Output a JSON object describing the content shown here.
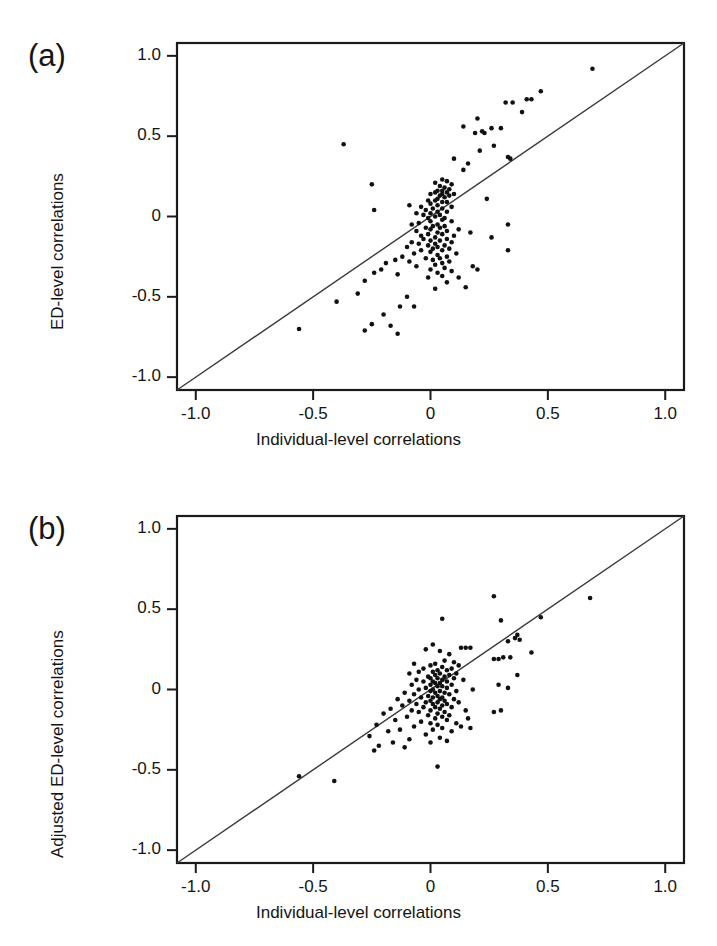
{
  "figure": {
    "type": "scientific-figure",
    "panel_count": 2,
    "background_color": "#ffffff",
    "ink_color": "#141414"
  },
  "panels": [
    {
      "tag": "(a)",
      "tag_name": "panel-a",
      "x_axis_label": "Individual-level correlations",
      "y_axis_label": "ED-level correlations"
    },
    {
      "tag": "(b)",
      "tag_name": "panel-b",
      "x_axis_label": "Individual-level correlations",
      "y_axis_label": "Adjusted ED-level correlations"
    }
  ],
  "ticks": {
    "x": [
      "-1.0",
      "-0.5",
      "0",
      "0.5",
      "1.0"
    ],
    "y": [
      "1.0",
      "0.5",
      "0",
      "-0.5",
      "-1.0"
    ],
    "x_values": [
      -1.0,
      -0.5,
      0,
      0.5,
      1.0
    ],
    "y_values": [
      1.0,
      0.5,
      0,
      -0.5,
      -1.0
    ]
  },
  "chart_data": [
    {
      "type": "scatter",
      "panel": "(a)",
      "title": "",
      "xlabel": "Individual-level correlations",
      "ylabel": "ED-level correlations",
      "xlim": [
        -1.08,
        1.08
      ],
      "ylim": [
        -1.08,
        1.08
      ],
      "grid": false,
      "legend": false,
      "marker": "filled-circle",
      "marker_color": "#111111",
      "marker_size_px": 4.6,
      "annotations": [
        {
          "kind": "reference-line",
          "label": "y = x identity line",
          "from": [
            -1.08,
            -1.08
          ],
          "to": [
            1.08,
            1.08
          ],
          "color": "#333333"
        }
      ],
      "n_points": 143,
      "points": [
        [
          0.69,
          0.92
        ],
        [
          0.47,
          0.78
        ],
        [
          0.41,
          0.73
        ],
        [
          0.43,
          0.73
        ],
        [
          0.32,
          0.71
        ],
        [
          0.35,
          0.71
        ],
        [
          0.39,
          0.65
        ],
        [
          0.2,
          0.61
        ],
        [
          0.14,
          0.56
        ],
        [
          0.26,
          0.55
        ],
        [
          0.3,
          0.55
        ],
        [
          0.22,
          0.53
        ],
        [
          0.23,
          0.52
        ],
        [
          0.19,
          0.52
        ],
        [
          -0.37,
          0.45
        ],
        [
          0.27,
          0.44
        ],
        [
          0.21,
          0.41
        ],
        [
          0.33,
          0.37
        ],
        [
          0.34,
          0.36
        ],
        [
          0.1,
          0.36
        ],
        [
          0.16,
          0.33
        ],
        [
          0.14,
          0.29
        ],
        [
          -0.25,
          0.2
        ],
        [
          0.05,
          0.23
        ],
        [
          0.07,
          0.22
        ],
        [
          0.02,
          0.21
        ],
        [
          0.09,
          0.2
        ],
        [
          0.04,
          0.19
        ],
        [
          0.06,
          0.18
        ],
        [
          0.08,
          0.17
        ],
        [
          0.03,
          0.16
        ],
        [
          0.05,
          0.16
        ],
        [
          0.07,
          0.15
        ],
        [
          0.02,
          0.15
        ],
        [
          0.1,
          0.14
        ],
        [
          0.05,
          0.14
        ],
        [
          0.0,
          0.14
        ],
        [
          0.04,
          0.13
        ],
        [
          0.08,
          0.13
        ],
        [
          0.06,
          0.12
        ],
        [
          0.24,
          0.11
        ],
        [
          0.03,
          0.11
        ],
        [
          -0.01,
          0.1
        ],
        [
          0.02,
          0.1
        ],
        [
          0.07,
          0.09
        ],
        [
          0.05,
          0.09
        ],
        [
          -0.09,
          0.07
        ],
        [
          0.0,
          0.08
        ],
        [
          0.03,
          0.07
        ],
        [
          0.09,
          0.06
        ],
        [
          -0.04,
          0.06
        ],
        [
          0.01,
          0.05
        ],
        [
          0.05,
          0.05
        ],
        [
          -0.24,
          0.04
        ],
        [
          -0.02,
          0.04
        ],
        [
          0.03,
          0.03
        ],
        [
          0.07,
          0.03
        ],
        [
          -0.06,
          0.02
        ],
        [
          0.0,
          0.02
        ],
        [
          0.04,
          0.01
        ],
        [
          -0.03,
          0.01
        ],
        [
          0.02,
          0.0
        ],
        [
          0.06,
          -0.01
        ],
        [
          -0.01,
          -0.01
        ],
        [
          0.33,
          -0.05
        ],
        [
          0.05,
          -0.02
        ],
        [
          0.0,
          -0.03
        ],
        [
          0.09,
          -0.03
        ],
        [
          -0.05,
          -0.04
        ],
        [
          0.03,
          -0.05
        ],
        [
          -0.08,
          -0.05
        ],
        [
          0.01,
          -0.06
        ],
        [
          0.06,
          -0.06
        ],
        [
          0.04,
          -0.07
        ],
        [
          -0.02,
          -0.07
        ],
        [
          0.12,
          -0.08
        ],
        [
          0.0,
          -0.08
        ],
        [
          0.07,
          -0.09
        ],
        [
          -0.06,
          -0.09
        ],
        [
          0.17,
          -0.1
        ],
        [
          0.03,
          -0.1
        ],
        [
          -0.01,
          -0.11
        ],
        [
          0.05,
          -0.11
        ],
        [
          0.1,
          -0.12
        ],
        [
          -0.04,
          -0.12
        ],
        [
          0.02,
          -0.13
        ],
        [
          0.26,
          -0.13
        ],
        [
          0.07,
          -0.14
        ],
        [
          -0.03,
          -0.14
        ],
        [
          0.0,
          -0.15
        ],
        [
          0.04,
          -0.15
        ],
        [
          -0.08,
          -0.16
        ],
        [
          0.09,
          -0.16
        ],
        [
          0.02,
          -0.17
        ],
        [
          0.33,
          -0.21
        ],
        [
          -0.05,
          -0.17
        ],
        [
          0.06,
          -0.18
        ],
        [
          -0.01,
          -0.18
        ],
        [
          0.03,
          -0.19
        ],
        [
          -0.1,
          -0.19
        ],
        [
          0.01,
          -0.2
        ],
        [
          0.08,
          -0.2
        ],
        [
          -0.04,
          -0.21
        ],
        [
          0.05,
          -0.21
        ],
        [
          0.0,
          -0.22
        ],
        [
          0.11,
          -0.23
        ],
        [
          -0.07,
          -0.23
        ],
        [
          0.03,
          -0.24
        ],
        [
          -0.12,
          -0.25
        ],
        [
          0.07,
          -0.25
        ],
        [
          -0.02,
          -0.26
        ],
        [
          0.04,
          -0.26
        ],
        [
          -0.15,
          -0.27
        ],
        [
          0.01,
          -0.27
        ],
        [
          0.08,
          -0.28
        ],
        [
          -0.09,
          -0.28
        ],
        [
          -0.19,
          -0.29
        ],
        [
          0.05,
          -0.29
        ],
        [
          0.02,
          -0.3
        ],
        [
          0.18,
          -0.31
        ],
        [
          0.2,
          -0.33
        ],
        [
          -0.06,
          -0.31
        ],
        [
          0.06,
          -0.32
        ],
        [
          -0.21,
          -0.33
        ],
        [
          0.0,
          -0.33
        ],
        [
          0.09,
          -0.34
        ],
        [
          -0.24,
          -0.35
        ],
        [
          0.03,
          -0.35
        ],
        [
          -0.14,
          -0.36
        ],
        [
          0.05,
          -0.37
        ],
        [
          0.12,
          -0.38
        ],
        [
          -0.01,
          -0.38
        ],
        [
          -0.28,
          -0.4
        ],
        [
          0.07,
          -0.41
        ],
        [
          0.15,
          -0.44
        ],
        [
          0.02,
          -0.45
        ],
        [
          -0.31,
          -0.48
        ],
        [
          -0.1,
          -0.5
        ],
        [
          -0.4,
          -0.53
        ],
        [
          -0.13,
          -0.56
        ],
        [
          -0.07,
          -0.56
        ],
        [
          -0.2,
          -0.61
        ],
        [
          -0.25,
          -0.67
        ],
        [
          -0.17,
          -0.68
        ],
        [
          -0.56,
          -0.7
        ],
        [
          -0.28,
          -0.71
        ],
        [
          -0.14,
          -0.73
        ]
      ]
    },
    {
      "type": "scatter",
      "panel": "(b)",
      "title": "",
      "xlabel": "Individual-level correlations",
      "ylabel": "Adjusted ED-level correlations",
      "xlim": [
        -1.08,
        1.08
      ],
      "ylim": [
        -1.08,
        1.08
      ],
      "grid": false,
      "legend": false,
      "marker": "filled-circle",
      "marker_color": "#111111",
      "marker_size_px": 4.6,
      "annotations": [
        {
          "kind": "reference-line",
          "label": "y = x identity line",
          "from": [
            -1.08,
            -1.08
          ],
          "to": [
            1.08,
            1.08
          ],
          "color": "#333333"
        }
      ],
      "n_points": 140,
      "points": [
        [
          0.68,
          0.57
        ],
        [
          0.27,
          0.58
        ],
        [
          0.47,
          0.45
        ],
        [
          0.05,
          0.44
        ],
        [
          0.3,
          0.43
        ],
        [
          0.37,
          0.34
        ],
        [
          0.36,
          0.32
        ],
        [
          0.38,
          0.31
        ],
        [
          0.33,
          0.3
        ],
        [
          0.01,
          0.28
        ],
        [
          0.13,
          0.26
        ],
        [
          0.15,
          0.26
        ],
        [
          0.17,
          0.26
        ],
        [
          -0.02,
          0.25
        ],
        [
          0.04,
          0.24
        ],
        [
          0.43,
          0.23
        ],
        [
          0.08,
          0.22
        ],
        [
          0.31,
          0.2
        ],
        [
          0.34,
          0.2
        ],
        [
          0.27,
          0.19
        ],
        [
          0.29,
          0.19
        ],
        [
          0.06,
          0.18
        ],
        [
          0.1,
          0.17
        ],
        [
          -0.07,
          0.16
        ],
        [
          0.02,
          0.16
        ],
        [
          0.12,
          0.15
        ],
        [
          0.0,
          0.15
        ],
        [
          0.05,
          0.14
        ],
        [
          0.09,
          0.13
        ],
        [
          -0.03,
          0.13
        ],
        [
          0.03,
          0.12
        ],
        [
          0.07,
          0.12
        ],
        [
          0.01,
          0.11
        ],
        [
          -0.05,
          0.11
        ],
        [
          0.04,
          0.1
        ],
        [
          0.11,
          0.1
        ],
        [
          -0.09,
          0.1
        ],
        [
          0.08,
          0.09
        ],
        [
          0.02,
          0.09
        ],
        [
          0.06,
          0.08
        ],
        [
          -0.01,
          0.08
        ],
        [
          0.0,
          0.07
        ],
        [
          0.03,
          0.07
        ],
        [
          0.1,
          0.07
        ],
        [
          -0.06,
          0.06
        ],
        [
          0.05,
          0.06
        ],
        [
          0.14,
          0.06
        ],
        [
          0.01,
          0.05
        ],
        [
          0.07,
          0.05
        ],
        [
          -0.03,
          0.05
        ],
        [
          0.04,
          0.04
        ],
        [
          0.37,
          0.09
        ],
        [
          0.02,
          0.04
        ],
        [
          0.09,
          0.03
        ],
        [
          -0.08,
          0.03
        ],
        [
          0.0,
          0.03
        ],
        [
          0.29,
          0.03
        ],
        [
          0.05,
          0.02
        ],
        [
          0.03,
          0.02
        ],
        [
          0.33,
          0.01
        ],
        [
          -0.02,
          0.01
        ],
        [
          0.07,
          0.01
        ],
        [
          0.01,
          0.0
        ],
        [
          0.18,
          0.0
        ],
        [
          -0.05,
          0.0
        ],
        [
          0.04,
          -0.01
        ],
        [
          0.11,
          -0.01
        ],
        [
          0.0,
          -0.01
        ],
        [
          0.06,
          -0.02
        ],
        [
          -0.11,
          -0.02
        ],
        [
          0.02,
          -0.02
        ],
        [
          -0.07,
          -0.03
        ],
        [
          0.08,
          -0.03
        ],
        [
          0.03,
          -0.04
        ],
        [
          -0.01,
          -0.04
        ],
        [
          0.05,
          -0.05
        ],
        [
          -0.04,
          -0.05
        ],
        [
          0.01,
          -0.05
        ],
        [
          0.1,
          -0.06
        ],
        [
          -0.14,
          -0.06
        ],
        [
          0.04,
          -0.06
        ],
        [
          -0.09,
          -0.07
        ],
        [
          0.06,
          -0.07
        ],
        [
          0.0,
          -0.07
        ],
        [
          -0.02,
          -0.08
        ],
        [
          0.03,
          -0.08
        ],
        [
          0.12,
          -0.08
        ],
        [
          -0.06,
          -0.09
        ],
        [
          0.07,
          -0.09
        ],
        [
          0.01,
          -0.09
        ],
        [
          -0.12,
          -0.1
        ],
        [
          0.05,
          -0.1
        ],
        [
          -0.03,
          -0.11
        ],
        [
          0.09,
          -0.11
        ],
        [
          0.02,
          -0.11
        ],
        [
          -0.17,
          -0.12
        ],
        [
          0.04,
          -0.12
        ],
        [
          0.15,
          -0.13
        ],
        [
          -0.08,
          -0.13
        ],
        [
          0.0,
          -0.13
        ],
        [
          0.06,
          -0.14
        ],
        [
          0.27,
          -0.14
        ],
        [
          -0.05,
          -0.14
        ],
        [
          0.3,
          -0.13
        ],
        [
          0.03,
          -0.15
        ],
        [
          -0.2,
          -0.15
        ],
        [
          0.08,
          -0.16
        ],
        [
          -0.01,
          -0.16
        ],
        [
          -0.1,
          -0.17
        ],
        [
          0.05,
          -0.17
        ],
        [
          0.16,
          -0.18
        ],
        [
          0.02,
          -0.18
        ],
        [
          -0.15,
          -0.19
        ],
        [
          0.07,
          -0.19
        ],
        [
          -0.04,
          -0.2
        ],
        [
          0.11,
          -0.21
        ],
        [
          0.0,
          -0.21
        ],
        [
          -0.23,
          -0.22
        ],
        [
          0.03,
          -0.22
        ],
        [
          -0.07,
          -0.23
        ],
        [
          0.13,
          -0.23
        ],
        [
          0.05,
          -0.24
        ],
        [
          0.17,
          -0.24
        ],
        [
          -0.13,
          -0.25
        ],
        [
          0.01,
          -0.25
        ],
        [
          -0.18,
          -0.26
        ],
        [
          0.09,
          -0.26
        ],
        [
          -0.02,
          -0.28
        ],
        [
          -0.26,
          -0.29
        ],
        [
          0.04,
          -0.3
        ],
        [
          -0.09,
          -0.31
        ],
        [
          0.07,
          -0.32
        ],
        [
          -0.16,
          -0.33
        ],
        [
          0.0,
          -0.33
        ],
        [
          -0.22,
          -0.35
        ],
        [
          -0.11,
          -0.36
        ],
        [
          -0.24,
          -0.38
        ],
        [
          0.03,
          -0.48
        ],
        [
          -0.56,
          -0.54
        ],
        [
          -0.41,
          -0.57
        ]
      ]
    }
  ]
}
